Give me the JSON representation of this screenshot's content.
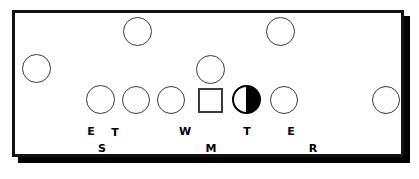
{
  "diagram": {
    "field": {
      "background_color": "#ffffff",
      "border_color": "#111111",
      "shadow_color": "#000000"
    },
    "markers": [
      {
        "id": "left-wide-circle",
        "shape": "circle",
        "x": 22,
        "y": 54,
        "size": 29,
        "fill": "white",
        "row": "flank-left"
      },
      {
        "id": "top-left-circle",
        "shape": "circle",
        "x": 123,
        "y": 17,
        "size": 29,
        "fill": "white",
        "row": "deep"
      },
      {
        "id": "top-right-circle",
        "shape": "circle",
        "x": 266,
        "y": 17,
        "size": 29,
        "fill": "white",
        "row": "deep"
      },
      {
        "id": "middle-circle",
        "shape": "circle",
        "x": 196,
        "y": 55,
        "size": 29,
        "fill": "white",
        "row": "linebacker"
      },
      {
        "id": "line-circle-1",
        "shape": "circle",
        "x": 86,
        "y": 85,
        "size": 29,
        "fill": "white",
        "row": "line"
      },
      {
        "id": "line-circle-2",
        "shape": "circle",
        "x": 122,
        "y": 86,
        "size": 28,
        "fill": "white",
        "row": "line"
      },
      {
        "id": "line-circle-3",
        "shape": "circle",
        "x": 157,
        "y": 86,
        "size": 28,
        "fill": "white",
        "row": "line"
      },
      {
        "id": "line-square",
        "shape": "square",
        "x": 198,
        "y": 88,
        "size": 25,
        "fill": "white",
        "row": "line"
      },
      {
        "id": "line-half-circle",
        "shape": "half-circle",
        "x": 232,
        "y": 85,
        "size": 29,
        "fill": "half-black-right",
        "row": "line"
      },
      {
        "id": "line-circle-4",
        "shape": "circle",
        "x": 270,
        "y": 86,
        "size": 28,
        "fill": "white",
        "row": "line"
      },
      {
        "id": "right-wide-circle",
        "shape": "circle",
        "x": 372,
        "y": 86,
        "size": 28,
        "fill": "white",
        "row": "flank-right"
      }
    ],
    "labels": [
      {
        "id": "label-e-left",
        "text": "E",
        "x": 84,
        "y": 126
      },
      {
        "id": "label-t-left",
        "text": "T",
        "x": 108,
        "y": 127
      },
      {
        "id": "label-s",
        "text": "S",
        "x": 95,
        "y": 143
      },
      {
        "id": "label-w",
        "text": "W",
        "x": 178,
        "y": 126
      },
      {
        "id": "label-m",
        "text": "M",
        "x": 204,
        "y": 143
      },
      {
        "id": "label-t-right",
        "text": "T",
        "x": 240,
        "y": 126
      },
      {
        "id": "label-e-right",
        "text": "E",
        "x": 284,
        "y": 126
      },
      {
        "id": "label-r",
        "text": "R",
        "x": 306,
        "y": 143
      }
    ]
  }
}
